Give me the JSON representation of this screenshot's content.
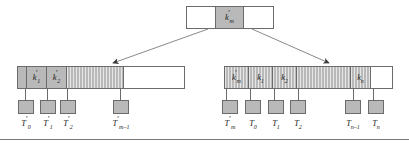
{
  "figure": {
    "caption": "",
    "colors": {
      "shaded_cell": "#b9b9b9",
      "border": "#6b6b6b",
      "background": "#ffffff",
      "rule": "#7a7a7a"
    }
  },
  "root": {
    "name": "root-node",
    "cells": [
      {
        "label": "",
        "shaded": false
      },
      {
        "label": "k'm",
        "key_base": "k",
        "prime": "′",
        "subscript": "m",
        "shaded": true
      },
      {
        "label": "",
        "shaded": false
      }
    ]
  },
  "left_node": {
    "name": "left-internal-node",
    "cells": [
      {
        "label": "",
        "shaded": true,
        "hatched": false,
        "width": 9
      },
      {
        "label": "k'1",
        "key_base": "k",
        "prime": "′",
        "subscript": "1",
        "shaded": true,
        "hatched": false,
        "width": 20
      },
      {
        "label": "k'2",
        "key_base": "k",
        "prime": "′",
        "subscript": "2",
        "shaded": true,
        "hatched": false,
        "width": 20
      },
      {
        "label": "",
        "shaded": true,
        "hatched": true,
        "width": 57
      },
      {
        "label": "",
        "shaded": false,
        "hatched": false,
        "width": 62
      }
    ]
  },
  "right_node": {
    "name": "right-internal-node",
    "cells": [
      {
        "label": "k'm",
        "key_base": "k",
        "prime": "′",
        "subscript": "m",
        "shaded": true,
        "hatched": true,
        "width": 24
      },
      {
        "label": "k1",
        "key_base": "k",
        "prime": "",
        "subscript": "1",
        "shaded": true,
        "hatched": true,
        "width": 24
      },
      {
        "label": "k2",
        "key_base": "k",
        "prime": "",
        "subscript": "2",
        "shaded": true,
        "hatched": true,
        "width": 24
      },
      {
        "label": "",
        "shaded": true,
        "hatched": true,
        "width": 56
      },
      {
        "label": "kn",
        "key_base": "k",
        "prime": "",
        "subscript": "n",
        "shaded": true,
        "hatched": true,
        "width": 20
      },
      {
        "label": "",
        "shaded": false,
        "hatched": false,
        "width": 21
      }
    ]
  },
  "left_leaves": [
    {
      "label": "T'0",
      "base": "T",
      "prime": "′",
      "subscript": "0",
      "x": 20,
      "stem_x": 25
    },
    {
      "label": "T'1",
      "base": "T",
      "prime": "′",
      "subscript": "1",
      "x": 45,
      "stem_x": 47
    },
    {
      "label": "T'2",
      "base": "T",
      "prime": "′",
      "subscript": "2",
      "x": 68,
      "stem_x": 67
    },
    {
      "label": "T'm-1",
      "base": "T",
      "prime": "′",
      "subscript": "m–1",
      "x": 112,
      "stem_x": 120
    }
  ],
  "right_leaves": [
    {
      "label": "T'm",
      "base": "T",
      "prime": "′",
      "subscript": "m",
      "x": 226,
      "stem_x": 226
    },
    {
      "label": "T0",
      "base": "T",
      "prime": "",
      "subscript": "0",
      "x": 250,
      "stem_x": 250
    },
    {
      "label": "T1",
      "base": "T",
      "prime": "",
      "subscript": "1",
      "x": 274,
      "stem_x": 274
    },
    {
      "label": "T2",
      "base": "T",
      "prime": "",
      "subscript": "2",
      "x": 296,
      "stem_x": 298
    },
    {
      "label": "Tn-1",
      "base": "T",
      "prime": "",
      "subscript": "n–1",
      "x": 344,
      "stem_x": 353
    },
    {
      "label": "Tn",
      "base": "T",
      "prime": "",
      "subscript": "n",
      "x": 370,
      "stem_x": 373
    }
  ],
  "connectors": [
    {
      "name": "root-to-left-child",
      "from_x": 208,
      "from_y": 29,
      "to_x": 112,
      "to_y": 63
    },
    {
      "name": "root-to-right-child",
      "from_x": 252,
      "from_y": 29,
      "to_x": 330,
      "to_y": 63
    }
  ]
}
